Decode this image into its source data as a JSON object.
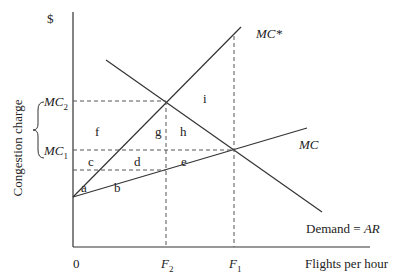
{
  "axes": {
    "y_unit": "$",
    "y_label": "Congestion charge",
    "x_label": "Flights per hour",
    "origin": "0",
    "y_ticks": [
      {
        "base": "MC",
        "sub": "2"
      },
      {
        "base": "MC",
        "sub": "1"
      }
    ],
    "x_ticks": [
      {
        "base": "F",
        "sub": "2"
      },
      {
        "base": "F",
        "sub": "1"
      }
    ]
  },
  "curves": {
    "mc_star": "MC*",
    "mc": "MC",
    "demand": "Demand = ",
    "demand_ar": "AR"
  },
  "regions": [
    "a",
    "b",
    "c",
    "d",
    "e",
    "f",
    "g",
    "h",
    "i"
  ],
  "colors": {
    "line": "#333333",
    "dash": "#555555"
  }
}
